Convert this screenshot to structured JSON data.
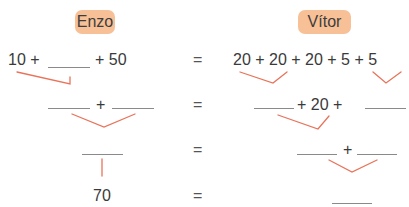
{
  "headers": {
    "left": "Enzo",
    "right": "Vítor"
  },
  "rows": [
    {
      "left": {
        "a": "10 +",
        "b": "+ 50"
      },
      "equals": "=",
      "right": {
        "text": "20 + 20 + 20 + 5 + 5"
      }
    },
    {
      "left": {
        "plus": "+"
      },
      "equals": "=",
      "right": {
        "middle": "+ 20 +"
      }
    },
    {
      "left": {},
      "equals": "=",
      "right": {
        "plus": "+"
      }
    },
    {
      "left": {
        "value": "70"
      },
      "equals": "=",
      "right": {}
    }
  ],
  "colors": {
    "badge": "#f7c096",
    "connector": "#e8735a",
    "blank": "#8a8a8a",
    "text": "#3a3a3a"
  }
}
